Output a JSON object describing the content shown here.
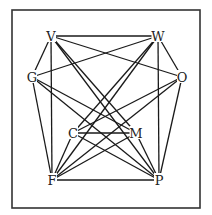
{
  "diagram": {
    "type": "graph",
    "frame": {
      "x": 12,
      "y": 10,
      "width": 188,
      "height": 198
    },
    "nodes": [
      {
        "id": "V",
        "label": "V",
        "x": 51,
        "y": 36
      },
      {
        "id": "W",
        "label": "W",
        "x": 158,
        "y": 36
      },
      {
        "id": "G",
        "label": "G",
        "x": 32,
        "y": 77
      },
      {
        "id": "O",
        "label": "O",
        "x": 182,
        "y": 77
      },
      {
        "id": "C",
        "label": "C",
        "x": 73,
        "y": 133
      },
      {
        "id": "M",
        "label": "M",
        "x": 136,
        "y": 133
      },
      {
        "id": "F",
        "label": "F",
        "x": 52,
        "y": 180
      },
      {
        "id": "P",
        "label": "P",
        "x": 159,
        "y": 180
      }
    ],
    "edges": [
      [
        "V",
        "W"
      ],
      [
        "V",
        "O"
      ],
      [
        "V",
        "G"
      ],
      [
        "V",
        "F"
      ],
      [
        "V",
        "M"
      ],
      [
        "V",
        "P"
      ],
      [
        "W",
        "G"
      ],
      [
        "W",
        "C"
      ],
      [
        "W",
        "F"
      ],
      [
        "W",
        "P"
      ],
      [
        "W",
        "O"
      ],
      [
        "G",
        "F"
      ],
      [
        "G",
        "M"
      ],
      [
        "G",
        "P"
      ],
      [
        "O",
        "P"
      ],
      [
        "O",
        "C"
      ],
      [
        "O",
        "F"
      ],
      [
        "C",
        "M"
      ],
      [
        "C",
        "F"
      ],
      [
        "C",
        "P"
      ],
      [
        "M",
        "F"
      ],
      [
        "M",
        "P"
      ],
      [
        "F",
        "P"
      ]
    ]
  }
}
